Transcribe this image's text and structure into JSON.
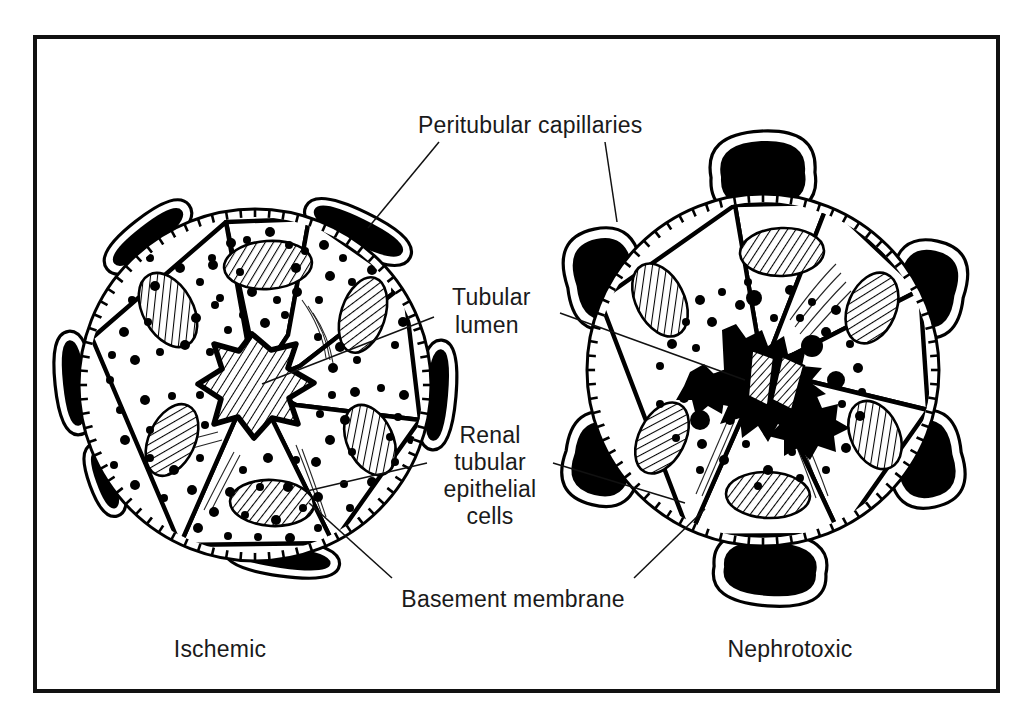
{
  "figure": {
    "frame": {
      "border_color": "#111111"
    },
    "ink_color": "#000000",
    "paper_color": "#ffffff"
  },
  "labels": {
    "peritubular_capillaries": "Peritubular capillaries",
    "tubular_lumen_line1": "Tubular",
    "tubular_lumen_line2": "lumen",
    "renal_epithelial_line1": "Renal",
    "renal_epithelial_line2": "tubular",
    "renal_epithelial_line3": "epithelial",
    "renal_epithelial_line4": "cells",
    "basement_membrane": "Basement membrane"
  },
  "captions": {
    "left": "Ischemic",
    "right": "Nephrotoxic"
  },
  "panels": [
    {
      "id": "ischemic",
      "caption": "Ischemic",
      "center": {
        "x": 255,
        "y": 385
      },
      "radius": 180,
      "cell_count": 6,
      "capillary_count": 6,
      "capillary_shape": "narrow-elongated-lens",
      "cytoplasm_stippling": "dense",
      "lumen_state": "patent-star-hatched",
      "lumen_debris": "none",
      "nucleus_count": 6,
      "nucleus_fill": "diagonal-hatch"
    },
    {
      "id": "nephrotoxic",
      "caption": "Nephrotoxic",
      "center": {
        "x": 763,
        "y": 370
      },
      "radius": 180,
      "cell_count": 6,
      "capillary_count": 6,
      "capillary_shape": "dilated-rounded-blob",
      "cytoplasm_stippling": "sparse-central",
      "lumen_state": "obstructed-necrotic-debris",
      "lumen_debris": "dense-black-masses",
      "nucleus_count": 6,
      "nucleus_fill": "diagonal-hatch"
    }
  ]
}
